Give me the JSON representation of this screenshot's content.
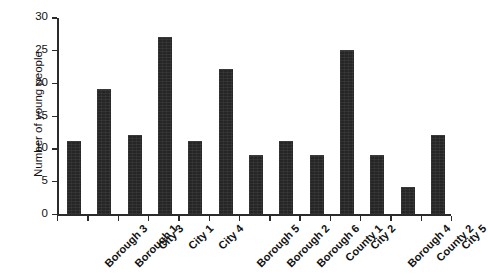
{
  "chart_data": {
    "type": "bar",
    "title": "",
    "title_note": "title cropped off above top edge of image",
    "xlabel": "",
    "ylabel": "Number of young people",
    "categories": [
      "Borough 3",
      "Borough 1",
      "City 3",
      "City 1",
      "City 4",
      "Borough 5",
      "Borough 2",
      "Borough 6",
      "County 1",
      "City 2",
      "Borough 4",
      "County 2",
      "City 5"
    ],
    "values": [
      11,
      19,
      12,
      27,
      11,
      22,
      9,
      11,
      9,
      25,
      9,
      4,
      12
    ],
    "ylim": [
      0,
      30
    ],
    "ytick_labels": [
      "0",
      "5",
      "10",
      "15",
      "20",
      "25",
      "30"
    ],
    "ytick_values": [
      0,
      5,
      10,
      15,
      20,
      25,
      30
    ],
    "grid": false,
    "legend": false,
    "bar_color": "#262626",
    "axis_color": "#2b2b2b",
    "background_color": "#ffffff",
    "xtick_label_rotation": -45
  }
}
